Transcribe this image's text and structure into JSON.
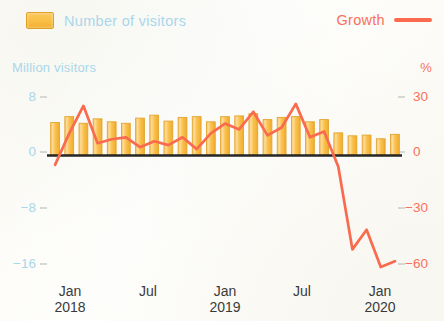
{
  "legend": {
    "bars_label": "Number of visitors",
    "line_label": "Growth",
    "bars_color": "#f9bf45",
    "line_color": "#f96a4e"
  },
  "axes": {
    "left_title": "Million visitors",
    "right_title": "%",
    "left_ticks": [
      "8",
      "0",
      "−8",
      "−16"
    ],
    "right_ticks": [
      "30",
      "0",
      "−30",
      "−60"
    ],
    "left_color": "#a9d7ea",
    "right_color": "#f9715a"
  },
  "x_labels": [
    {
      "month": "Jan",
      "year": "2018"
    },
    {
      "month": "Jul",
      "year": ""
    },
    {
      "month": "Jan",
      "year": "2019"
    },
    {
      "month": "Jul",
      "year": ""
    },
    {
      "month": "Jan",
      "year": "2020"
    }
  ],
  "chart_data": {
    "type": "bar",
    "title": "",
    "subtitle": "",
    "xlabel": "",
    "ylabel": "Million visitors",
    "y2label": "%",
    "ylim": [
      -16,
      8
    ],
    "y2lim": [
      -60,
      30
    ],
    "yticks": [
      8,
      0,
      -8,
      -16
    ],
    "y2ticks": [
      30,
      0,
      -30,
      -60
    ],
    "grid": false,
    "legend_position": "top",
    "categories": [
      "Jan 2018",
      "Feb 2018",
      "Mar 2018",
      "Apr 2018",
      "May 2018",
      "Jun 2018",
      "Jul 2018",
      "Aug 2018",
      "Sep 2018",
      "Oct 2018",
      "Nov 2018",
      "Dec 2018",
      "Jan 2019",
      "Feb 2019",
      "Mar 2019",
      "Apr 2019",
      "May 2019",
      "Jun 2019",
      "Jul 2019",
      "Aug 2019",
      "Sep 2019",
      "Oct 2019",
      "Nov 2019",
      "Dec 2019",
      "Jan 2020"
    ],
    "series": [
      {
        "name": "Number of visitors",
        "type": "bar",
        "axis": "left",
        "unit": "million",
        "color": "#f9bf45",
        "values": [
          4.4,
          5.2,
          4.3,
          4.9,
          4.5,
          4.3,
          5.0,
          5.4,
          4.6,
          5.1,
          5.2,
          4.5,
          5.2,
          5.3,
          5.6,
          4.8,
          5.1,
          5.2,
          4.5,
          4.8,
          3.0,
          2.6,
          2.7,
          2.2,
          2.8
        ]
      },
      {
        "name": "Growth",
        "type": "line",
        "axis": "right",
        "unit": "percent",
        "color": "#f96a4e",
        "values": [
          -5,
          11,
          25,
          6,
          8,
          9,
          4,
          7,
          5,
          9,
          3,
          11,
          16,
          13,
          22,
          10,
          14,
          26,
          9,
          12,
          -6,
          -48,
          -38,
          -57,
          -54
        ]
      }
    ]
  }
}
